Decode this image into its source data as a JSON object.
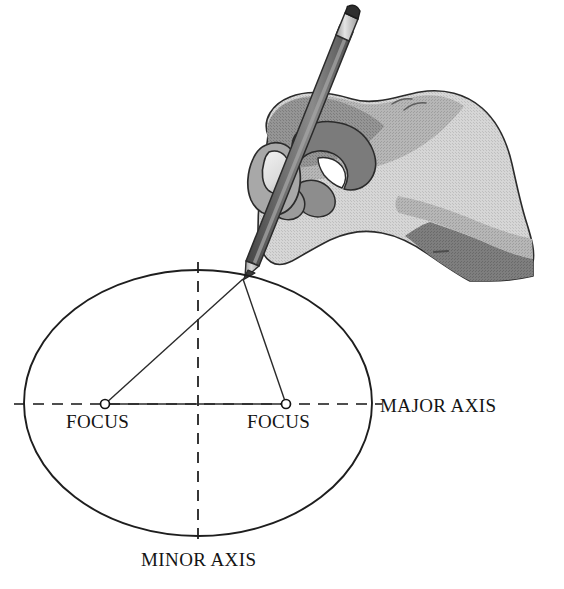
{
  "diagram": {
    "labels": {
      "focus_left": "FOCUS",
      "focus_right": "FOCUS",
      "major_axis": "MAJOR AXIS",
      "minor_axis": "MINOR AXIS"
    },
    "icons": {
      "hand": "hand-icon",
      "pencil": "pencil-icon",
      "focus_marker": "focus-point-icon"
    },
    "colors": {
      "background": "#ffffff",
      "ink": "#141414",
      "outline": "#2b2b2b",
      "hand_light": "#d2d2d2",
      "hand_mid": "#b3b3b3",
      "hand_dark": "#8f8f8f",
      "hand_shadow": "#757575",
      "pencil_body": "#6d6d6d",
      "pencil_body_dark": "#4a4a4a",
      "pencil_ferrule": "#d8d8d8",
      "pencil_eraser": "#2e2e2e",
      "pencil_wood": "#c9c9c9",
      "pencil_lead": "#3a3a3a"
    },
    "geometry": {
      "ellipse": {
        "cx": 198,
        "cy": 403,
        "rx": 174,
        "ry": 133
      },
      "focus_left_point": {
        "x": 105,
        "y": 404
      },
      "focus_right_point": {
        "x": 286,
        "y": 404
      },
      "pencil_tip_point": {
        "x": 243,
        "y": 279
      },
      "major_axis_line": {
        "x1": 14,
        "y1": 404,
        "x2": 382,
        "y2": 404
      },
      "minor_axis_line": {
        "x1": 198,
        "y1": 262,
        "x2": 198,
        "y2": 546
      },
      "focus_marker_radius": 4.5
    },
    "label_positions": {
      "focus_left": {
        "x": 66,
        "y": 428
      },
      "focus_right": {
        "x": 247,
        "y": 428
      },
      "major_axis": {
        "x": 380,
        "y": 412
      },
      "minor_axis": {
        "x": 141,
        "y": 566
      }
    }
  }
}
